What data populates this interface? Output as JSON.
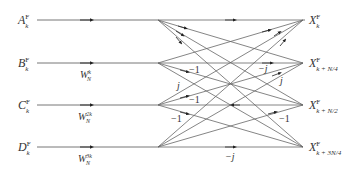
{
  "diagram": {
    "type": "radix-4 butterfly signal-flow graph",
    "inputs": [
      {
        "name": "A",
        "sup": "F",
        "sub": "k",
        "twiddle": null
      },
      {
        "name": "B",
        "sup": "F",
        "sub": "k",
        "twiddle": {
          "base": "W",
          "sup": "k",
          "sub": "N"
        }
      },
      {
        "name": "C",
        "sup": "F",
        "sub": "k",
        "twiddle": {
          "base": "W",
          "sup": "2k",
          "sub": "N"
        }
      },
      {
        "name": "D",
        "sup": "F",
        "sub": "k",
        "twiddle": {
          "base": "W",
          "sup": "3k",
          "sub": "N"
        }
      }
    ],
    "outputs": [
      {
        "name": "X",
        "sup": "F",
        "sub": "k"
      },
      {
        "name": "X",
        "sup": "F",
        "sub": "k + N/4"
      },
      {
        "name": "X",
        "sup": "F",
        "sub": "k + N/2"
      },
      {
        "name": "X",
        "sup": "F",
        "sub": "k + 3N/4"
      }
    ],
    "edge_labels": [
      "−1",
      "j",
      "−1",
      "−1",
      "−j",
      "j",
      "−1",
      "−j"
    ],
    "line_color": "#555555"
  }
}
